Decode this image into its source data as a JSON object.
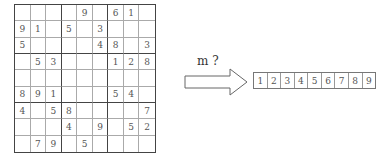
{
  "sudoku": {
    "rows": [
      [
        "",
        "",
        "",
        "",
        "9",
        "",
        "6",
        "1",
        ""
      ],
      [
        "9",
        "1",
        "",
        "5",
        "",
        "3",
        "",
        "",
        ""
      ],
      [
        "5",
        "",
        "",
        "",
        "",
        "4",
        "8",
        "",
        "3"
      ],
      [
        "",
        "5",
        "3",
        "",
        "",
        "",
        "1",
        "2",
        "8"
      ],
      [
        "",
        "",
        "",
        "",
        "",
        "",
        "",
        "",
        ""
      ],
      [
        "8",
        "9",
        "1",
        "",
        "",
        "",
        "5",
        "4",
        ""
      ],
      [
        "4",
        "",
        "5",
        "8",
        "",
        "",
        "",
        "",
        "7"
      ],
      [
        "",
        "",
        "",
        "4",
        "",
        "9",
        "",
        "5",
        "2"
      ],
      [
        "",
        "7",
        "9",
        "",
        "5",
        "",
        "",
        "",
        ""
      ]
    ]
  },
  "arrow": {
    "label": "m ?",
    "icon": "right-arrow-icon"
  },
  "candidates": {
    "values": [
      "1",
      "2",
      "3",
      "4",
      "5",
      "6",
      "7",
      "8",
      "9"
    ]
  }
}
